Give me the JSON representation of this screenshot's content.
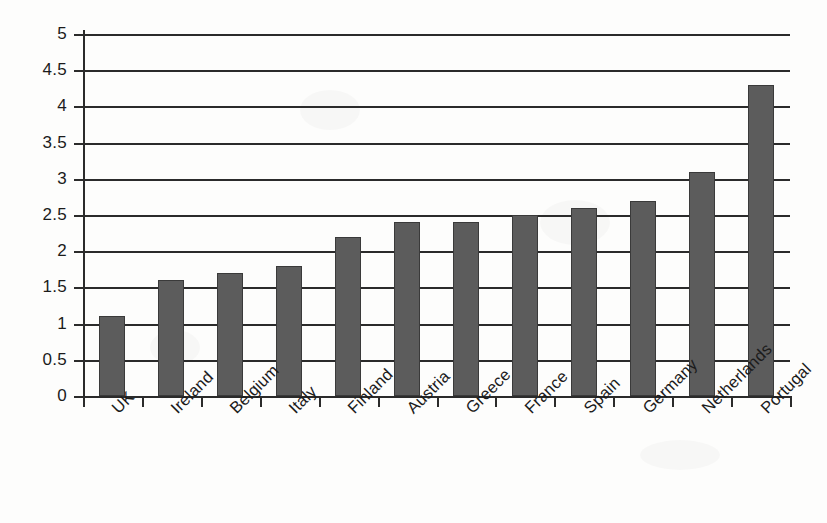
{
  "chart_data": {
    "type": "bar",
    "title": "",
    "xlabel": "",
    "ylabel": "",
    "categories": [
      "UK",
      "Ireland",
      "Belgium",
      "Italy",
      "Finland",
      "Austria",
      "Greece",
      "France",
      "Spain",
      "Germany",
      "Netherlands",
      "Portugal"
    ],
    "values": [
      1.1,
      1.6,
      1.7,
      1.8,
      2.2,
      2.4,
      2.4,
      2.5,
      2.6,
      2.7,
      3.1,
      4.3
    ],
    "ylim": [
      0,
      5
    ],
    "ytick_labels": [
      "0",
      "0.5",
      "1",
      "1.5",
      "2",
      "2.5",
      "3",
      "3.5",
      "4",
      "4.5",
      "5"
    ],
    "ytick_values": [
      0,
      0.5,
      1,
      1.5,
      2,
      2.5,
      3,
      3.5,
      4,
      4.5,
      5
    ],
    "grid": true,
    "legend": "none",
    "bar_color": "#5c5c5c",
    "bar_border_color": "#3a3a3a",
    "axis_color": "#2b2b2b",
    "background_color": "#fdfdfc",
    "xtick_label_rotation": -45
  }
}
